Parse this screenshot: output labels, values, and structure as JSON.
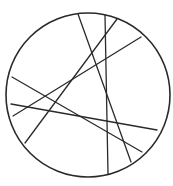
{
  "diagram": {
    "type": "circle-with-chords",
    "stroke_color": "#2a2a2a",
    "background": "#ffffff",
    "circle": {
      "cx": 88,
      "cy": 95,
      "r": 82,
      "stroke_width": 1.6
    },
    "chords": [
      {
        "x1": 78,
        "y1": 14,
        "x2": 131,
        "y2": 162
      },
      {
        "x1": 105,
        "y1": 15,
        "x2": 108,
        "y2": 174
      },
      {
        "x1": 117,
        "y1": 19,
        "x2": 25,
        "y2": 143
      },
      {
        "x1": 141,
        "y1": 37,
        "x2": 13,
        "y2": 116
      },
      {
        "x1": 12,
        "y1": 77,
        "x2": 142,
        "y2": 152
      },
      {
        "x1": 11,
        "y1": 104,
        "x2": 157,
        "y2": 130
      }
    ],
    "chord_stroke_width": 1.3
  }
}
